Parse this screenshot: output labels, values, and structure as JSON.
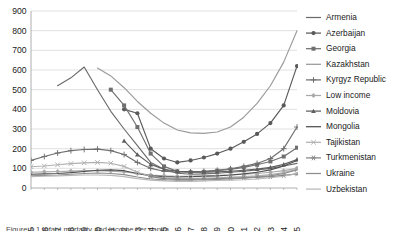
{
  "chart_data": {
    "type": "line",
    "title": "",
    "xlabel": "",
    "ylabel": "",
    "ylim": [
      0,
      900
    ],
    "ytick_step": 100,
    "yticks": [
      0,
      100,
      200,
      300,
      400,
      500,
      600,
      700,
      800,
      900
    ],
    "grid": "horizontal",
    "legend_position": "right",
    "x": [
      1985,
      1986,
      1987,
      1988,
      1989,
      1990,
      1991,
      1992,
      1993,
      1994,
      1995,
      1996,
      1997,
      1998,
      1999,
      2000,
      2001,
      2002,
      2003,
      2004,
      2005
    ],
    "series": [
      {
        "name": "Armenia",
        "marker": "none",
        "color": "#6b6b6b",
        "values": [
          null,
          null,
          520,
          560,
          615,
          500,
          390,
          300,
          215,
          130,
          95,
          75,
          70,
          72,
          75,
          80,
          85,
          92,
          100,
          112,
          125
        ]
      },
      {
        "name": "Azerbaijan",
        "marker": "circle",
        "color": "#595959",
        "values": [
          null,
          null,
          null,
          null,
          null,
          null,
          null,
          400,
          380,
          200,
          150,
          130,
          140,
          155,
          175,
          200,
          235,
          275,
          330,
          420,
          620
        ]
      },
      {
        "name": "Georgia",
        "marker": "square",
        "color": "#6f6f6f",
        "values": [
          null,
          null,
          null,
          null,
          null,
          null,
          500,
          420,
          310,
          175,
          110,
          85,
          80,
          82,
          88,
          95,
          105,
          118,
          135,
          160,
          205
        ]
      },
      {
        "name": "Kazakhstan",
        "marker": "none",
        "color": "#9a9a9a",
        "values": [
          null,
          null,
          null,
          null,
          null,
          610,
          570,
          510,
          440,
          380,
          330,
          295,
          280,
          278,
          285,
          310,
          360,
          430,
          520,
          640,
          800
        ]
      },
      {
        "name": "Kyrgyz Republic",
        "marker": "plus",
        "color": "#6e6e6e",
        "values": [
          140,
          160,
          178,
          190,
          196,
          198,
          190,
          170,
          130,
          100,
          85,
          80,
          82,
          85,
          90,
          98,
          110,
          125,
          150,
          200,
          310
        ]
      },
      {
        "name": "Low income",
        "marker": "diamond",
        "color": "#a8a8a8",
        "values": [
          80,
          82,
          84,
          86,
          88,
          88,
          86,
          82,
          74,
          66,
          62,
          60,
          60,
          62,
          64,
          66,
          70,
          74,
          80,
          88,
          100
        ]
      },
      {
        "name": "Moldovia",
        "marker": "triangle",
        "color": "#5f5f5f",
        "values": [
          null,
          null,
          null,
          null,
          null,
          null,
          null,
          240,
          170,
          120,
          95,
          85,
          82,
          80,
          82,
          85,
          90,
          96,
          105,
          120,
          145
        ]
      },
      {
        "name": "Mongolia",
        "marker": "none",
        "color": "#4f4f4f",
        "values": [
          70,
          72,
          74,
          78,
          84,
          90,
          92,
          88,
          74,
          62,
          58,
          56,
          58,
          60,
          62,
          66,
          72,
          80,
          92,
          112,
          140
        ]
      },
      {
        "name": "Tajikistan",
        "marker": "cross",
        "color": "#b0b0b0",
        "values": [
          108,
          112,
          118,
          124,
          128,
          130,
          126,
          110,
          80,
          60,
          52,
          48,
          48,
          50,
          52,
          55,
          58,
          62,
          68,
          78,
          95
        ]
      },
      {
        "name": "Turkmenistan",
        "marker": "asterisk",
        "color": "#858585",
        "values": [
          null,
          null,
          null,
          null,
          null,
          null,
          null,
          null,
          null,
          58,
          48,
          44,
          44,
          46,
          48,
          50,
          52,
          55,
          58,
          64,
          72
        ]
      },
      {
        "name": "Ukraine",
        "marker": "none",
        "color": "#8d8d8d",
        "values": [
          62,
          64,
          66,
          70,
          74,
          76,
          74,
          68,
          56,
          46,
          42,
          40,
          40,
          42,
          44,
          46,
          50,
          55,
          62,
          74,
          92
        ]
      },
      {
        "name": "Uzbekistan",
        "marker": "none",
        "color": "#b8b8b8",
        "values": [
          58,
          60,
          62,
          64,
          66,
          66,
          64,
          58,
          48,
          40,
          36,
          34,
          34,
          36,
          38,
          40,
          42,
          46,
          52,
          60,
          74
        ]
      }
    ]
  },
  "caption": {
    "text": "Figure 1.1 Infant mortality and income per capita"
  }
}
